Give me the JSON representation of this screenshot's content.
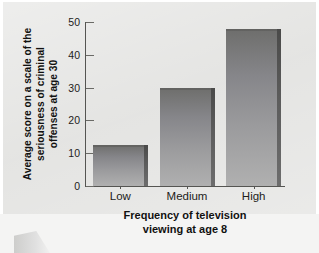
{
  "chart_data": {
    "type": "bar",
    "title": "",
    "categories": [
      "Low",
      "Medium",
      "High"
    ],
    "values": [
      12.5,
      30,
      48
    ],
    "series": [
      {
        "name": "Average seriousness of criminal offenses at age 30",
        "values": [
          12.5,
          30,
          48
        ]
      }
    ],
    "xlabel": "Frequency of television viewing at age 8",
    "ylabel": "Average score on a scale of the seriousness of criminal offenses at age 30",
    "yticks": [
      0,
      10,
      20,
      30,
      40,
      50
    ],
    "ytick_labels": [
      "0",
      "10",
      "20",
      "30",
      "40",
      "50"
    ],
    "ylim": [
      0,
      50
    ],
    "grid": false,
    "legend": false,
    "legend_position": "none",
    "bar_color": "#8f8f90",
    "axis_color": "#555552",
    "background_color": "#e3e3e1"
  },
  "axis": {
    "ylabel_lines": [
      "Average score on a scale of the",
      "seriousness of criminal",
      "offenses at age 30"
    ],
    "xlabel_lines": [
      "Frequency of television",
      "viewing at age 8"
    ]
  }
}
